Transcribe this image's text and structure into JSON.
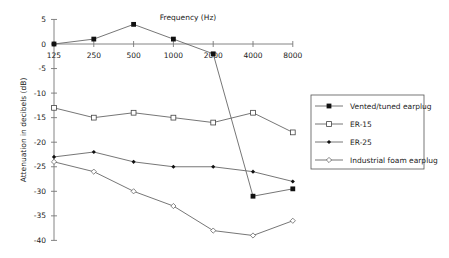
{
  "chart_data": {
    "type": "line",
    "title": "",
    "xlabel": "Frequency (Hz)",
    "ylabel": "Attenuation in decibels (dB)",
    "categories": [
      "125",
      "250",
      "500",
      "1000",
      "2000",
      "4000",
      "8000"
    ],
    "ylim": [
      -40,
      5
    ],
    "yticks": [
      5,
      0,
      -5,
      -10,
      -15,
      -20,
      -25,
      -30,
      -35,
      -40
    ],
    "grid": false,
    "legend_position": "right",
    "series": [
      {
        "name": "Vented/tuned earplug",
        "marker": "filled-square",
        "values": [
          0,
          1,
          4,
          1,
          -2,
          -31,
          -29.5
        ]
      },
      {
        "name": "ER-15",
        "marker": "open-square",
        "values": [
          -13,
          -15,
          -14,
          -15,
          -16,
          -14,
          -18
        ]
      },
      {
        "name": "ER-25",
        "marker": "filled-diamond",
        "values": [
          -23,
          -22,
          -24,
          -25,
          -25,
          -26,
          -28
        ]
      },
      {
        "name": "Industrial foam earplug",
        "marker": "open-diamond",
        "values": [
          -24,
          -26,
          -30,
          -33,
          -38,
          -39,
          -36
        ]
      }
    ]
  },
  "colors": {
    "line": "#666666",
    "axis": "#777777",
    "marker": "#111111",
    "text": "#222222"
  }
}
